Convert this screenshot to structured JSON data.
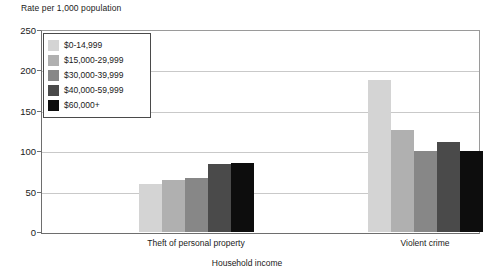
{
  "chart_data": {
    "type": "bar",
    "title": "",
    "ylabel": "Rate per 1,000 population",
    "xlabel": "Household income",
    "categories": [
      "Theft of personal property",
      "Violent crime"
    ],
    "ylim": [
      0,
      250
    ],
    "yticks": [
      0,
      50,
      100,
      150,
      200,
      250
    ],
    "ytick_labels": [
      "0",
      "50",
      "100",
      "150",
      "200",
      "250"
    ],
    "grid": "horizontal",
    "legend_position": "top-left-inside",
    "series": [
      {
        "name": "$0-14,999",
        "color": "#d4d4d4",
        "values": [
          59,
          188
        ]
      },
      {
        "name": "$15,000-29,999",
        "color": "#b0b0b0",
        "values": [
          64,
          126
        ]
      },
      {
        "name": "$30,000-39,999",
        "color": "#878787",
        "values": [
          67,
          100
        ]
      },
      {
        "name": "$40,000-59,999",
        "color": "#4a4a4a",
        "values": [
          84,
          112
        ]
      },
      {
        "name": "$60,000+",
        "color": "#0d0d0d",
        "values": [
          85,
          100
        ]
      }
    ]
  }
}
